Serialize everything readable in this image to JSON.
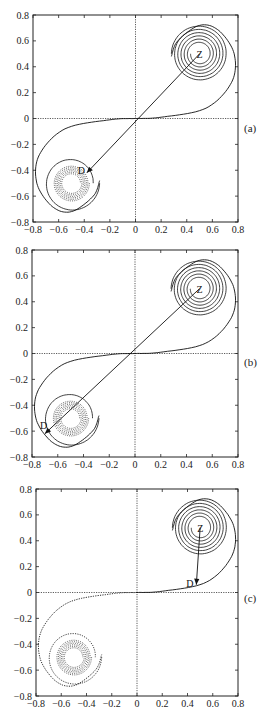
{
  "chart_data": [
    {
      "type": "line",
      "panel_label": "(a)",
      "xlim": [
        -0.8,
        0.8
      ],
      "ylim": [
        -0.8,
        0.8
      ],
      "xticks": [
        "-0.8",
        "-0.6",
        "-0.4",
        "-0.2",
        "0",
        "0.2",
        "0.4",
        "0.6",
        "0.8"
      ],
      "yticks": [
        "0.8",
        "0.6",
        "0.4",
        "0.2",
        "0",
        "-0.2",
        "-0.4",
        "-0.6",
        "-0.8"
      ],
      "spirals": {
        "upper_center": [
          0.5,
          0.5
        ],
        "lower_center": [
          -0.5,
          -0.5
        ],
        "outer_radius": 0.22
      },
      "upper_style": "solid",
      "lower_arm_style": "solid",
      "lower_core_style": "dotted",
      "arrow": {
        "from_label": "Z",
        "to_label": "D",
        "from": [
          0.5,
          0.5
        ],
        "to": [
          -0.38,
          -0.42
        ]
      },
      "axes_dotted_at_zero": true
    },
    {
      "type": "line",
      "panel_label": "(b)",
      "xlim": [
        -0.8,
        0.8
      ],
      "ylim": [
        -0.8,
        0.8
      ],
      "xticks": [
        "-0.8",
        "-0.6",
        "-0.4",
        "-0.2",
        "0",
        "0.2",
        "0.4",
        "0.6",
        "0.8"
      ],
      "yticks": [
        "0.8",
        "0.6",
        "0.4",
        "0.2",
        "0",
        "-0.2",
        "-0.4",
        "-0.6",
        "-0.8"
      ],
      "spirals": {
        "upper_center": [
          0.5,
          0.5
        ],
        "lower_center": [
          -0.5,
          -0.5
        ],
        "outer_radius": 0.22
      },
      "upper_style": "solid",
      "lower_arm_style": "solid",
      "lower_core_style": "dotted",
      "arrow": {
        "from_label": "Z",
        "to_label": "D",
        "from": [
          0.5,
          0.5
        ],
        "to": [
          -0.7,
          -0.62
        ]
      },
      "axes_dotted_at_zero": true
    },
    {
      "type": "line",
      "panel_label": "(c)",
      "xlim": [
        -0.8,
        0.8
      ],
      "ylim": [
        -0.8,
        0.8
      ],
      "xticks": [
        "-0.8",
        "-0.6",
        "-0.4",
        "-0.2",
        "0",
        "0.2",
        "0.4",
        "0.6",
        "0.8"
      ],
      "yticks": [
        "0.8",
        "0.6",
        "0.4",
        "0.2",
        "0",
        "-0.2",
        "-0.4",
        "-0.6",
        "-0.8"
      ],
      "spirals": {
        "upper_center": [
          0.5,
          0.5
        ],
        "lower_center": [
          -0.5,
          -0.5
        ],
        "outer_radius": 0.22
      },
      "upper_style": "solid",
      "lower_arm_style": "dotted",
      "lower_core_style": "dotted",
      "arrow": {
        "from_label": "Z",
        "to_label": "D",
        "from": [
          0.5,
          0.5
        ],
        "to": [
          0.47,
          0.06
        ]
      },
      "axes_dotted_at_zero": true
    }
  ],
  "layout_boxes": [
    {
      "L": 33,
      "T": 15,
      "R": 238,
      "B": 222,
      "label_x": 244,
      "label_y": 132
    },
    {
      "L": 32,
      "T": 250,
      "R": 238,
      "B": 457,
      "label_x": 244,
      "label_y": 366
    },
    {
      "L": 36,
      "T": 489,
      "R": 238,
      "B": 696,
      "label_x": 244,
      "label_y": 602
    }
  ]
}
